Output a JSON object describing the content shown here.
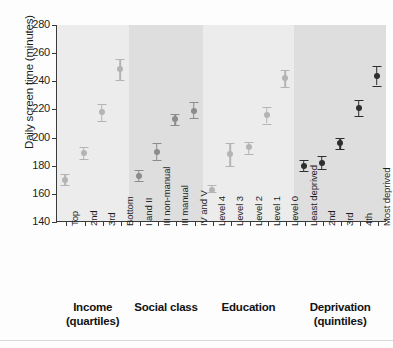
{
  "chart_data": {
    "type": "scatter",
    "title": "",
    "xlabel": "",
    "ylabel": "Daily screen time (minutes)",
    "ylim": [
      140,
      280
    ],
    "yticks": [
      140,
      160,
      180,
      200,
      220,
      240,
      260,
      280
    ],
    "grid": false,
    "legend": "none",
    "error_bars": "95% confidence interval",
    "groups": [
      {
        "name": "Income",
        "sublabel": "(quartiles)",
        "band": "light",
        "marker_color": "#b4b4b4",
        "categories": [
          "Top",
          "2nd",
          "3rd",
          "Bottom"
        ],
        "values": [
          170,
          189,
          218,
          249
        ],
        "ci_low": [
          166,
          185,
          212,
          241
        ],
        "ci_high": [
          174,
          193,
          224,
          256
        ]
      },
      {
        "name": "Social class",
        "sublabel": "",
        "band": "dark",
        "marker_color": "#8c8c8c",
        "categories": [
          "I and II",
          "III non-manual",
          "III manual",
          "IV and V"
        ],
        "values": [
          173,
          190,
          213,
          219
        ],
        "ci_low": [
          169,
          184,
          209,
          214
        ],
        "ci_high": [
          177,
          196,
          217,
          225
        ]
      },
      {
        "name": "Education",
        "sublabel": "",
        "band": "light",
        "marker_color": "#b4b4b4",
        "categories": [
          "Level 4",
          "Level 3",
          "Level 2",
          "Level 1",
          "Level 0"
        ],
        "values": [
          163,
          188,
          193,
          216,
          242
        ],
        "ci_low": [
          161,
          180,
          188,
          210,
          236
        ],
        "ci_high": [
          166,
          196,
          197,
          222,
          248
        ]
      },
      {
        "name": "Deprivation",
        "sublabel": "(quintiles)",
        "band": "dark",
        "marker_color": "#2e2e2e",
        "categories": [
          "Least deprived",
          "2nd",
          "3rd",
          "4th",
          "Most deprived"
        ],
        "values": [
          180,
          182,
          196,
          221,
          244
        ],
        "ci_low": [
          176,
          178,
          192,
          215,
          237
        ],
        "ci_high": [
          184,
          187,
          200,
          227,
          251
        ]
      }
    ]
  },
  "axis": {
    "y_title": "Daily screen time (minutes)",
    "y_tick_labels": [
      "280",
      "260",
      "240",
      "220",
      "200",
      "180",
      "160",
      "140"
    ]
  },
  "captions": {
    "income": "Income",
    "income_sub": "(quartiles)",
    "social_class": "Social class",
    "social_class_sub": "",
    "education": "Education",
    "education_sub": "",
    "deprivation": "Deprivation",
    "deprivation_sub": "(quintiles)"
  }
}
